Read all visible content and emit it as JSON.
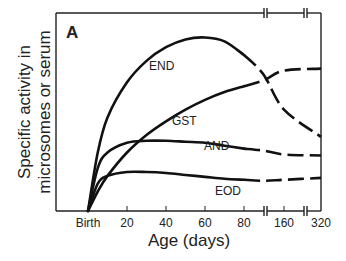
{
  "chart_data": {
    "type": "line",
    "panel_label": "A",
    "title": "",
    "xlabel": "Age (days)",
    "ylabel_line1": "Specific activity in",
    "ylabel_line2": "microsomes or serum",
    "x_ticks": [
      "Birth",
      "20",
      "40",
      "60",
      "80",
      "160",
      "320"
    ],
    "x_tick_values": [
      0,
      20,
      40,
      60,
      80,
      160,
      320
    ],
    "axis_breaks": [
      "between 80 and 160",
      "between 160 and 320"
    ],
    "y_ticks": [],
    "ylim": [
      0,
      100
    ],
    "grid": false,
    "legend": "inline labels",
    "series": [
      {
        "name": "END",
        "label": "END",
        "x": [
          0,
          5,
          10,
          20,
          30,
          40,
          50,
          60,
          70,
          80,
          90,
          160,
          320
        ],
        "values": [
          0,
          30,
          48,
          66,
          77,
          84,
          88,
          89,
          87,
          80,
          70,
          52,
          38
        ],
        "dashed_after": 80
      },
      {
        "name": "GST",
        "label": "GST",
        "x": [
          0,
          5,
          10,
          20,
          30,
          40,
          50,
          60,
          70,
          80,
          90,
          160,
          320
        ],
        "values": [
          0,
          10,
          18,
          30,
          39,
          46,
          52,
          57,
          61,
          64,
          67,
          72,
          73
        ],
        "dashed_after": 80
      },
      {
        "name": "AND",
        "label": "AND",
        "x": [
          0,
          5,
          10,
          20,
          30,
          40,
          50,
          60,
          70,
          80,
          90,
          160,
          320
        ],
        "values": [
          0,
          22,
          30,
          35,
          36,
          36,
          35.5,
          35,
          33.5,
          32,
          31,
          29,
          28.5
        ],
        "dashed_after": 80
      },
      {
        "name": "EOD",
        "label": "EOD",
        "x": [
          0,
          5,
          10,
          20,
          30,
          40,
          50,
          60,
          70,
          80,
          90,
          160,
          320
        ],
        "values": [
          0,
          14,
          18,
          20,
          20,
          19.5,
          18.5,
          17.5,
          16.5,
          16,
          15.5,
          16,
          17
        ],
        "dashed_after": 80
      }
    ]
  }
}
